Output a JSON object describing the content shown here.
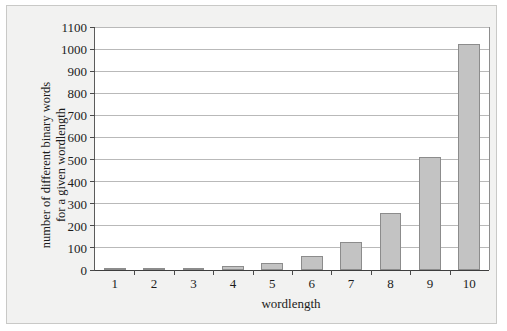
{
  "chart_data": {
    "type": "bar",
    "title": "",
    "subtitle": "",
    "xlabel": "wordlength",
    "ylabel_line1": "number of different binary words",
    "ylabel_line2": "for a given wordlength",
    "categories": [
      "1",
      "2",
      "3",
      "4",
      "5",
      "6",
      "7",
      "8",
      "9",
      "10"
    ],
    "values": [
      2,
      4,
      8,
      16,
      32,
      64,
      128,
      256,
      512,
      1024
    ],
    "series": [
      {
        "name": "number of different binary words",
        "values": [
          2,
          4,
          8,
          16,
          32,
          64,
          128,
          256,
          512,
          1024
        ]
      }
    ],
    "ylim": [
      0,
      1100
    ],
    "ytick_labels": [
      "0",
      "100",
      "200",
      "300",
      "400",
      "500",
      "600",
      "700",
      "800",
      "900",
      "1000",
      "1100"
    ],
    "ytick_values": [
      0,
      100,
      200,
      300,
      400,
      500,
      600,
      700,
      800,
      900,
      1000,
      1100
    ],
    "grid": "horizontal",
    "legend": "none",
    "bar_color": "#c3c3c3",
    "bar_edge_color": "#8c8c8c",
    "gridline_color": "#b9b9b9",
    "axis_color": "#3e3e3e",
    "figure_background": "#f2f2f1",
    "plot_background": "#ffffff"
  }
}
